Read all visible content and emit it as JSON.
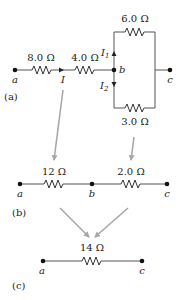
{
  "figure": {
    "panels": [
      {
        "id": "a",
        "label": "(a)",
        "nodes": [
          "a",
          "b",
          "c"
        ],
        "resistors": [
          {
            "value": "8.0 Ω",
            "position": "series a-b (first)"
          },
          {
            "value": "4.0 Ω",
            "position": "series a-b (second)"
          },
          {
            "value": "6.0 Ω",
            "position": "parallel b-c upper branch"
          },
          {
            "value": "3.0 Ω",
            "position": "parallel b-c lower branch"
          }
        ],
        "currents": [
          "I",
          "I1",
          "I2"
        ]
      },
      {
        "id": "b",
        "label": "(b)",
        "nodes": [
          "a",
          "b",
          "c"
        ],
        "resistors": [
          {
            "value": "12 Ω",
            "position": "a-b"
          },
          {
            "value": "2.0 Ω",
            "position": "b-c"
          }
        ]
      },
      {
        "id": "c",
        "label": "(c)",
        "nodes": [
          "a",
          "c"
        ],
        "resistors": [
          {
            "value": "14 Ω",
            "position": "a-c"
          }
        ]
      }
    ]
  },
  "labels": {
    "panel_a": "(a)",
    "panel_b": "(b)",
    "panel_c": "(c)",
    "r8": "8.0 Ω",
    "r4": "4.0 Ω",
    "r6": "6.0 Ω",
    "r3": "3.0 Ω",
    "r12": "12 Ω",
    "r2": "2.0 Ω",
    "r14": "14 Ω",
    "node_a": "a",
    "node_b": "b",
    "node_c": "c",
    "current_I": "I",
    "current_I1_base": "I",
    "current_I1_sub": "1",
    "current_I2_base": "I",
    "current_I2_sub": "2"
  },
  "colors": {
    "wire": "#555555",
    "arrow_gray": "#a8a8a8",
    "node": "#111111"
  }
}
